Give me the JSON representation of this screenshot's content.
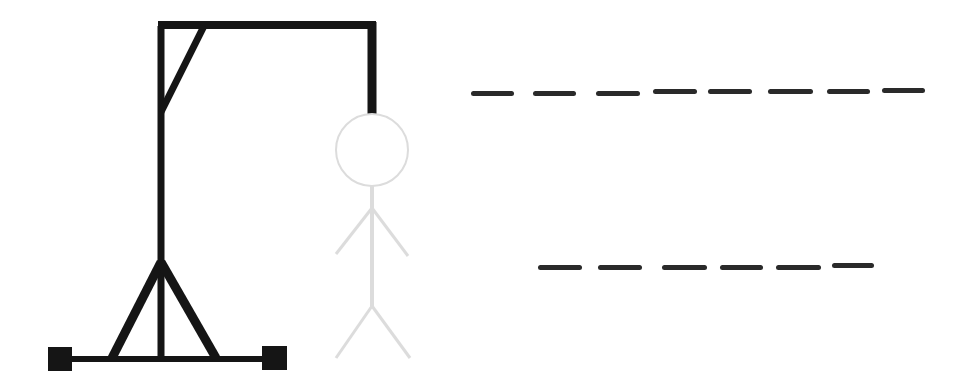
{
  "game": {
    "type": "hangman",
    "colors": {
      "gallows": "#151515",
      "figure_hidden": "#dcdcdc",
      "blank": "#2a2a2a",
      "background": "#ffffff"
    },
    "gallows": {
      "base_left_block": {
        "x": 48,
        "y": 347,
        "w": 24,
        "h": 24
      },
      "base_right_block": {
        "x": 262,
        "y": 346,
        "w": 25,
        "h": 24
      },
      "base_beam": {
        "x1": 72,
        "y1": 359,
        "x2": 262,
        "y2": 359
      },
      "upright": {
        "x1": 161,
        "y1": 26,
        "x2": 161,
        "y2": 358
      },
      "left_leg": {
        "x1": 161,
        "y1": 262,
        "x2": 112,
        "y2": 358
      },
      "right_leg": {
        "x1": 161,
        "y1": 262,
        "x2": 216,
        "y2": 358
      },
      "top_beam": {
        "x1": 158,
        "y1": 25,
        "x2": 376,
        "y2": 25
      },
      "brace": {
        "x1": 204,
        "y1": 26,
        "x2": 161,
        "y2": 112
      },
      "rope": {
        "x1": 372,
        "y1": 22,
        "x2": 372,
        "y2": 114
      }
    },
    "figure": {
      "visible": false,
      "head": {
        "cx": 372,
        "cy": 150,
        "r": 36
      },
      "body": {
        "x1": 372,
        "y1": 186,
        "x2": 372,
        "y2": 306
      },
      "left_arm": {
        "x1": 372,
        "y1": 208,
        "x2": 336,
        "y2": 254
      },
      "right_arm": {
        "x1": 372,
        "y1": 208,
        "x2": 408,
        "y2": 256
      },
      "left_leg": {
        "x1": 372,
        "y1": 306,
        "x2": 336,
        "y2": 358
      },
      "right_leg": {
        "x1": 372,
        "y1": 306,
        "x2": 410,
        "y2": 358
      }
    },
    "words": [
      {
        "letter_count": 8,
        "revealed": [
          "",
          "",
          "",
          "",
          "",
          "",
          "",
          ""
        ],
        "blanks": [
          {
            "x": 471,
            "y": 91,
            "w": 43
          },
          {
            "x": 533,
            "y": 91,
            "w": 43
          },
          {
            "x": 596,
            "y": 91,
            "w": 44
          },
          {
            "x": 653,
            "y": 89,
            "w": 44
          },
          {
            "x": 708,
            "y": 89,
            "w": 44
          },
          {
            "x": 768,
            "y": 89,
            "w": 45
          },
          {
            "x": 827,
            "y": 89,
            "w": 43
          },
          {
            "x": 882,
            "y": 88,
            "w": 43
          }
        ]
      },
      {
        "letter_count": 6,
        "revealed": [
          "",
          "",
          "",
          "",
          "",
          ""
        ],
        "blanks": [
          {
            "x": 538,
            "y": 265,
            "w": 44
          },
          {
            "x": 598,
            "y": 265,
            "w": 44
          },
          {
            "x": 662,
            "y": 265,
            "w": 45
          },
          {
            "x": 720,
            "y": 265,
            "w": 43
          },
          {
            "x": 776,
            "y": 265,
            "w": 45
          },
          {
            "x": 832,
            "y": 263,
            "w": 42
          }
        ]
      }
    ]
  }
}
